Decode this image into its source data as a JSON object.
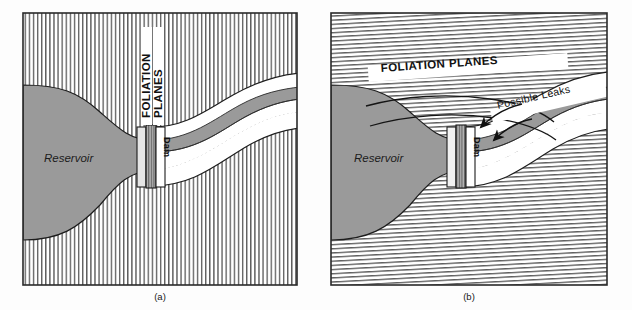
{
  "figure": {
    "background_color": "#fdfdfd",
    "panel_count": 2
  },
  "colors": {
    "reservoir_fill": "#9a9a9a",
    "river_fill": "#9a9a9a",
    "hatch_line": "#4d4d4d",
    "outline": "#111111",
    "dam_core_fill": "#8f8f8f",
    "dam_face_fill": "#d8d8d8",
    "white_fill": "#ffffff",
    "frame_border": "#2a2a2a"
  },
  "panel_a": {
    "caption": "(a)",
    "hatch_orientation": "vertical",
    "hatch_spacing_px": 4,
    "labels": {
      "foliation_line1": "FOLIATION",
      "foliation_line2": "PLANES",
      "foliation_rotation_deg": -90,
      "dam": "Dam",
      "dam_rotation_deg": 90,
      "reservoir": "Reservoir"
    },
    "description": "Foliation planes strike parallel to the valley axis, crossing the dam axis at right angles."
  },
  "panel_b": {
    "caption": "(b)",
    "hatch_orientation": "horizontal",
    "hatch_spacing_px": 4,
    "hatch_tilt_deg": -3,
    "labels": {
      "foliation": "FOLIATION PLANES",
      "foliation_rotation_deg": -4,
      "dam": "Dam",
      "dam_rotation_deg": 90,
      "reservoir": "Reservoir",
      "leaks": "Possible  Leaks",
      "leaks_rotation_deg": -13
    },
    "arrows": {
      "count": 2,
      "direction": "from reservoir around dam abutment to downstream valley"
    },
    "description": "Foliation planes strike across the valley so seepage can pass around the dam abutments."
  }
}
